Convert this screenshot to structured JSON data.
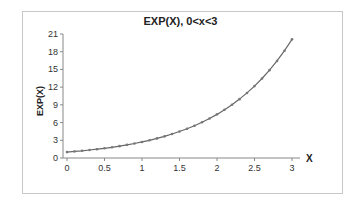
{
  "chart_data": {
    "type": "line",
    "title": "EXP(X), 0<x<3",
    "xlabel": "X",
    "ylabel": "EXP(X)",
    "xlim": [
      0,
      3
    ],
    "ylim": [
      0,
      21
    ],
    "xticks": [
      "0",
      "0.5",
      "1",
      "1.5",
      "2",
      "2.5",
      "3"
    ],
    "yticks": [
      "0",
      "3",
      "6",
      "9",
      "12",
      "15",
      "18",
      "21"
    ],
    "grid": false,
    "legend": null,
    "series": [
      {
        "name": "EXP(X)",
        "markers": true,
        "x": [
          0,
          0.1,
          0.2,
          0.3,
          0.4,
          0.5,
          0.6,
          0.7,
          0.8,
          0.9,
          1.0,
          1.1,
          1.2,
          1.3,
          1.4,
          1.5,
          1.6,
          1.7,
          1.8,
          1.9,
          2.0,
          2.1,
          2.2,
          2.3,
          2.4,
          2.5,
          2.6,
          2.7,
          2.8,
          2.9,
          3.0
        ],
        "values": [
          1.0,
          1.11,
          1.22,
          1.35,
          1.49,
          1.65,
          1.82,
          2.01,
          2.23,
          2.46,
          2.72,
          3.0,
          3.32,
          3.67,
          4.06,
          4.48,
          4.95,
          5.47,
          6.05,
          6.69,
          7.39,
          8.17,
          9.03,
          9.97,
          11.02,
          12.18,
          13.46,
          14.88,
          16.44,
          18.17,
          20.09
        ]
      }
    ]
  }
}
